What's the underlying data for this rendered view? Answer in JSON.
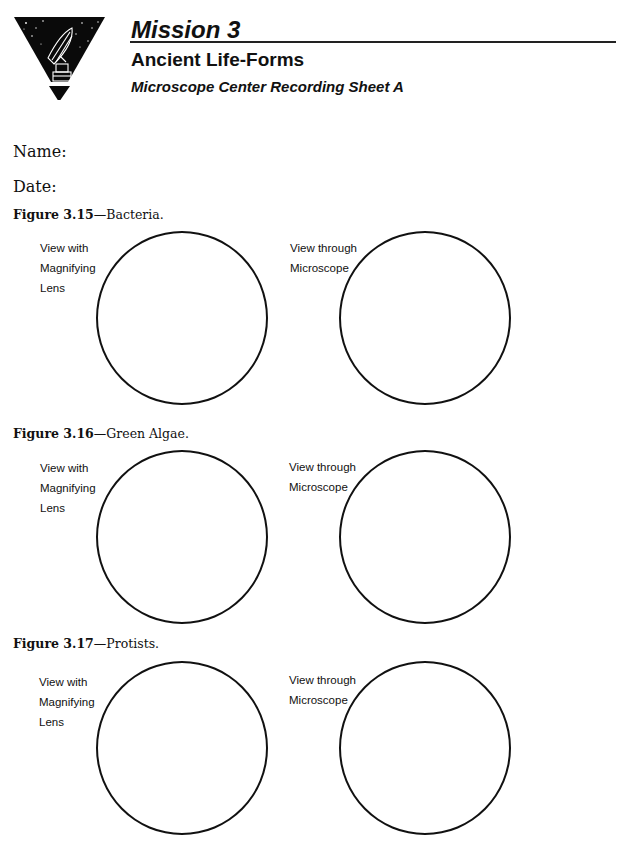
{
  "header": {
    "mission": "Mission 3",
    "subtitle": "Ancient Life-Forms",
    "sheet_title": "Microscope Center Recording Sheet A",
    "logo_icon": "radio-telescope-triangle-icon"
  },
  "fields": {
    "name_label": "Name:",
    "date_label": "Date:"
  },
  "figures": [
    {
      "number": "Figure 3.15",
      "title": "—Bacteria.",
      "left_label": [
        "View with",
        "Magnifying",
        "Lens"
      ],
      "right_label": [
        "View through",
        "Microscope"
      ]
    },
    {
      "number": "Figure 3.16",
      "title": "—Green Algae.",
      "left_label": [
        "View with",
        "Magnifying",
        "Lens"
      ],
      "right_label": [
        "View through",
        "Microscope"
      ]
    },
    {
      "number": "Figure 3.17",
      "title": "—Protists.",
      "left_label": [
        "View with",
        "Magnifying",
        "Lens"
      ],
      "right_label": [
        "View through",
        "Microscope"
      ]
    }
  ]
}
